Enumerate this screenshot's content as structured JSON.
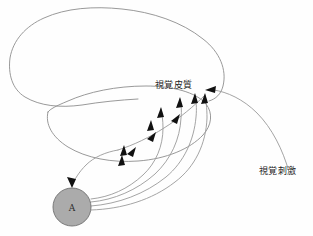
{
  "figure": {
    "background_color": "#fefefe",
    "outline_color": "#8d8d8d",
    "pathway_color": "#9a9a9a",
    "arrowhead_color": "#111111",
    "node_fill_color": "#ababab",
    "node_stroke_color": "#6f6f6f",
    "text_color": "#1c1c1c"
  },
  "labels": {
    "visual_cortex": "視覚皮質",
    "visual_stimulus": "視覚刺激"
  },
  "nodes": {
    "area_a": {
      "label": "A",
      "cx": 72,
      "cy": 207,
      "r": 19
    }
  },
  "shapes": {
    "cortex_outline_name": "cerebral-cortex-outline",
    "cerebellum_outline_name": "cerebellum-outline"
  },
  "connections": {
    "feedforward_count": 4,
    "feedback_count": 1,
    "stimulus_count": 1,
    "chain_arrow_count": 3
  }
}
